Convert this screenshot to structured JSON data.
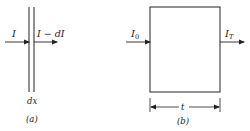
{
  "figure_a": {
    "input_label": "I",
    "output_label": "I − dI",
    "thickness_label": "dx",
    "caption": "(a)"
  },
  "figure_b": {
    "input_label": "I",
    "input_sub": "0",
    "output_label": "I",
    "output_sub": "T",
    "thickness_label": "t",
    "caption": "(b)"
  },
  "colors": {
    "ink": "#222222",
    "background": "#ffffff"
  }
}
